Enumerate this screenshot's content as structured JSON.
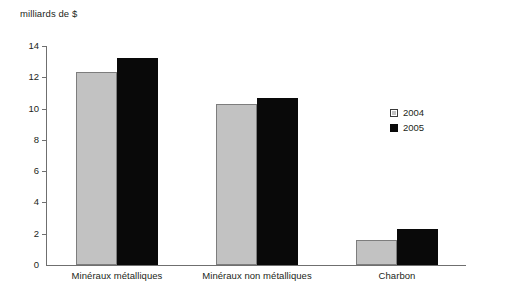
{
  "chart_data": {
    "type": "bar",
    "title": "milliards de $",
    "xlabel": "",
    "ylabel": "milliards de $",
    "ylim": [
      0,
      14
    ],
    "yticks": [
      0,
      2,
      4,
      6,
      8,
      10,
      12,
      14
    ],
    "ytick_labels": [
      "0",
      "2",
      "4",
      "6",
      "8",
      "10",
      "12",
      "14"
    ],
    "grid": false,
    "legend_position": "right",
    "categories": [
      "Minéraux métalliques",
      "Minéraux non métalliques",
      "Charbon"
    ],
    "series": [
      {
        "name": "2004",
        "color": "#c2c2c2",
        "values": [
          12.35,
          10.3,
          1.6
        ]
      },
      {
        "name": "2005",
        "color": "#090909",
        "values": [
          13.25,
          10.65,
          2.3
        ]
      }
    ]
  },
  "legend": {
    "items": [
      {
        "label": "2004"
      },
      {
        "label": "2005"
      }
    ]
  },
  "colors": {
    "series_2004": "#c2c2c2",
    "series_2005": "#090909",
    "axis": "#6f6f6f",
    "text": "#231f20",
    "background": "#ffffff"
  }
}
